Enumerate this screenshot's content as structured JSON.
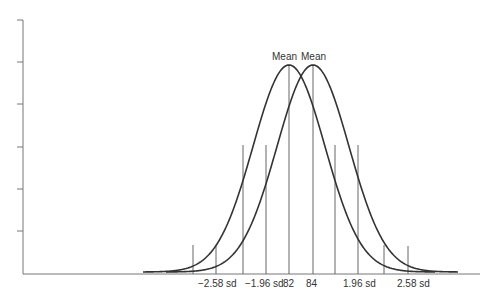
{
  "chart_data": {
    "type": "line",
    "title": "",
    "xlabel": "",
    "ylabel": "",
    "series": [
      {
        "name": "Distribution (mean 82)",
        "mean": 82,
        "peak_label": "Mean"
      },
      {
        "name": "Distribution (mean 84)",
        "mean": 84,
        "peak_label": "Mean"
      }
    ],
    "x_tick_labels": [
      "−2.58 sd",
      "−1.96 sd",
      "82",
      "84",
      "1.96 sd",
      "2.58 sd"
    ],
    "annotations": [
      "Mean",
      "Mean"
    ],
    "y_ticks_count": 6,
    "grid": false,
    "legend": "none",
    "colors": {
      "curve": "#333333",
      "axis": "#777777",
      "guide": "#666666"
    }
  },
  "labels": {
    "mean_left": "Mean",
    "mean_right": "Mean",
    "tick_neg258": "−2.58 sd",
    "tick_neg196": "−1.96 sd",
    "tick_82": "82",
    "tick_84": "84",
    "tick_pos196": "1.96 sd",
    "tick_pos258": "2.58 sd"
  }
}
